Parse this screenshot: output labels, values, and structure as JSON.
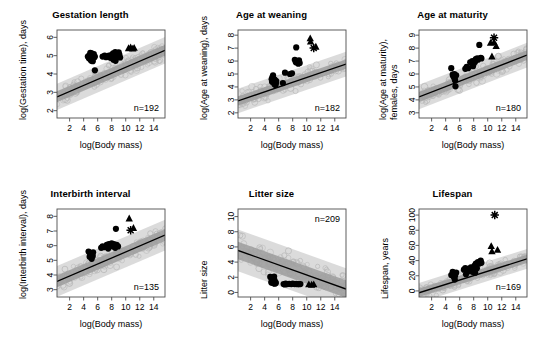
{
  "figure": {
    "layout": "2 rows x 3 columns",
    "shared_xlabel": "log(Body mass)",
    "x_ticks": [
      2,
      4,
      6,
      8,
      10,
      12,
      14
    ],
    "xlim": [
      0.2,
      15.6
    ],
    "colors": {
      "point_primate": "#000000",
      "point_other": "#b8b8b8",
      "band_outer": "#d9d9d9",
      "band_inner": "#9e9e9e",
      "regression_line": "#000000",
      "axis": "#4d4d4d",
      "background": "#ffffff"
    },
    "marker_legend": [
      {
        "symbol": "filled-circle",
        "name": "circle-marker"
      },
      {
        "symbol": "filled-triangle",
        "name": "triangle-marker"
      },
      {
        "symbol": "star",
        "name": "star-marker"
      },
      {
        "symbol": "open-circle",
        "name": "open-circle-marker"
      }
    ]
  },
  "chart_data": [
    {
      "id": "gestation-length",
      "type": "scatter",
      "title": "Gestation length",
      "xlabel": "log(Body mass)",
      "ylabel": "log(Gestation time), days",
      "ylabel_lines": [
        "log(Gestation time), days"
      ],
      "n_label": "n=192",
      "n": 192,
      "n_position": "bottom-right",
      "xlim": [
        0.2,
        15.6
      ],
      "ylim": [
        1.6,
        6.4
      ],
      "x_ticks": [
        2,
        4,
        6,
        8,
        10,
        12,
        14
      ],
      "y_ticks": [
        2,
        3,
        4,
        5,
        6
      ],
      "grid": false,
      "regression": {
        "intercept": 2.72,
        "slope": 0.165
      },
      "band_inner_halfwidth": 0.3,
      "band_outer_halfwidth": 0.72,
      "series": [
        {
          "name": "primates-circles",
          "marker": "filled-circle",
          "points": [
            [
              4.6,
              4.95
            ],
            [
              4.8,
              5.02
            ],
            [
              4.9,
              4.88
            ],
            [
              5.0,
              5.05
            ],
            [
              5.1,
              4.92
            ],
            [
              5.2,
              5.0
            ],
            [
              5.0,
              4.78
            ],
            [
              5.25,
              4.83
            ],
            [
              4.75,
              4.86
            ],
            [
              5.35,
              4.97
            ],
            [
              5.1,
              4.72
            ],
            [
              5.3,
              4.7
            ],
            [
              5.5,
              4.9
            ],
            [
              5.45,
              5.08
            ],
            [
              5.6,
              4.95
            ],
            [
              5.15,
              5.12
            ],
            [
              4.95,
              5.15
            ],
            [
              5.6,
              4.2
            ],
            [
              6.7,
              4.95
            ],
            [
              7.0,
              5.0
            ],
            [
              7.2,
              4.92
            ],
            [
              7.6,
              5.0
            ],
            [
              8.0,
              5.05
            ],
            [
              8.1,
              4.9
            ],
            [
              8.2,
              5.12
            ],
            [
              8.35,
              5.0
            ],
            [
              8.4,
              4.85
            ],
            [
              8.5,
              5.2
            ],
            [
              8.6,
              5.05
            ],
            [
              8.7,
              4.9
            ],
            [
              8.8,
              5.1
            ],
            [
              8.9,
              4.95
            ],
            [
              9.0,
              5.18
            ],
            [
              9.1,
              5.05
            ],
            [
              8.25,
              4.78
            ],
            [
              8.55,
              4.72
            ],
            [
              9.2,
              4.9
            ],
            [
              7.8,
              4.88
            ]
          ]
        },
        {
          "name": "great-apes-triangles",
          "marker": "filled-triangle",
          "points": [
            [
              10.4,
              5.4
            ],
            [
              10.7,
              5.45
            ],
            [
              11.0,
              5.38
            ],
            [
              11.2,
              5.42
            ]
          ]
        }
      ]
    },
    {
      "id": "age-at-weaning",
      "type": "scatter",
      "title": "Age at weaning",
      "xlabel": "log(Body mass)",
      "ylabel": "log(Age at weaning), days",
      "ylabel_lines": [
        "log(Age at weaning), days"
      ],
      "n_label": "n=182",
      "n": 182,
      "n_position": "bottom-right",
      "xlim": [
        0.2,
        15.6
      ],
      "ylim": [
        1.6,
        8.4
      ],
      "x_ticks": [
        2,
        4,
        6,
        8,
        10,
        12,
        14
      ],
      "y_ticks": [
        2,
        3,
        4,
        5,
        6,
        7,
        8
      ],
      "grid": false,
      "regression": {
        "intercept": 2.88,
        "slope": 0.185
      },
      "band_inner_halfwidth": 0.36,
      "band_outer_halfwidth": 0.95,
      "series": [
        {
          "name": "primates-circles",
          "marker": "filled-circle",
          "points": [
            [
              5.0,
              4.6
            ],
            [
              5.1,
              4.75
            ],
            [
              5.2,
              4.5
            ],
            [
              5.3,
              4.62
            ],
            [
              5.35,
              4.3
            ],
            [
              5.4,
              4.2
            ],
            [
              5.5,
              4.35
            ],
            [
              5.55,
              4.15
            ],
            [
              5.6,
              4.28
            ],
            [
              5.2,
              4.9
            ],
            [
              5.05,
              4.4
            ],
            [
              5.45,
              4.55
            ],
            [
              5.65,
              4.45
            ],
            [
              6.6,
              4.3
            ],
            [
              6.9,
              5.1
            ],
            [
              7.6,
              5.0
            ],
            [
              7.9,
              5.05
            ],
            [
              8.3,
              6.1
            ],
            [
              8.5,
              7.05
            ],
            [
              8.6,
              5.95
            ],
            [
              8.8,
              5.8
            ],
            [
              9.0,
              5.85
            ],
            [
              8.9,
              6.05
            ],
            [
              8.45,
              5.9
            ]
          ]
        },
        {
          "name": "great-apes-triangles",
          "marker": "filled-triangle",
          "points": [
            [
              10.5,
              7.75
            ],
            [
              10.55,
              7.5
            ],
            [
              11.3,
              7.1
            ]
          ]
        },
        {
          "name": "human-star",
          "marker": "star",
          "points": [
            [
              11.0,
              7.0
            ]
          ]
        }
      ]
    },
    {
      "id": "age-at-maturity",
      "type": "scatter",
      "title": "Age at maturity",
      "xlabel": "log(Body mass)",
      "ylabel": "log(Age at maturity), females, days",
      "ylabel_lines": [
        "log(Age at maturity),",
        "females, days"
      ],
      "n_label": "n=180",
      "n": 180,
      "n_position": "bottom-right",
      "xlim": [
        0.2,
        15.6
      ],
      "ylim": [
        2.6,
        9.4
      ],
      "x_ticks": [
        2,
        4,
        6,
        8,
        10,
        12,
        14
      ],
      "y_ticks": [
        3,
        4,
        5,
        6,
        7,
        8,
        9
      ],
      "grid": false,
      "regression": {
        "intercept": 4.18,
        "slope": 0.21
      },
      "band_inner_halfwidth": 0.38,
      "band_outer_halfwidth": 0.95,
      "series": [
        {
          "name": "primates-circles",
          "marker": "filled-circle",
          "points": [
            [
              4.8,
              6.45
            ],
            [
              5.0,
              5.95
            ],
            [
              5.1,
              5.8
            ],
            [
              5.2,
              5.85
            ],
            [
              5.25,
              6.0
            ],
            [
              5.3,
              5.6
            ],
            [
              5.35,
              5.5
            ],
            [
              5.4,
              5.05
            ],
            [
              5.5,
              5.9
            ],
            [
              6.8,
              6.4
            ],
            [
              7.0,
              6.55
            ],
            [
              7.2,
              6.45
            ],
            [
              7.5,
              6.9
            ],
            [
              7.8,
              7.0
            ],
            [
              8.0,
              6.8
            ],
            [
              8.3,
              7.15
            ],
            [
              8.5,
              7.2
            ],
            [
              8.6,
              7.1
            ],
            [
              8.8,
              8.25
            ],
            [
              9.0,
              7.25
            ],
            [
              9.1,
              7.2
            ],
            [
              8.2,
              6.95
            ],
            [
              7.9,
              6.6
            ]
          ]
        },
        {
          "name": "great-apes-triangles",
          "marker": "filled-triangle",
          "points": [
            [
              10.4,
              8.4
            ],
            [
              10.9,
              8.45
            ],
            [
              11.2,
              8.15
            ],
            [
              10.6,
              7.35
            ]
          ]
        },
        {
          "name": "human-star",
          "marker": "star",
          "points": [
            [
              10.9,
              8.8
            ]
          ]
        }
      ]
    },
    {
      "id": "interbirth-interval",
      "type": "scatter",
      "title": "Interbirth interval",
      "xlabel": "log(Body mass)",
      "ylabel": "log(Interbirth interval), days",
      "ylabel_lines": [
        "log(Interbirth interval), days"
      ],
      "n_label": "n=135",
      "n": 135,
      "n_position": "bottom-right",
      "xlim": [
        0.2,
        15.6
      ],
      "ylim": [
        2.5,
        8.5
      ],
      "x_ticks": [
        2,
        4,
        6,
        8,
        10,
        12,
        14
      ],
      "y_ticks": [
        3,
        4,
        5,
        6,
        7,
        8
      ],
      "grid": false,
      "regression": {
        "intercept": 3.52,
        "slope": 0.205
      },
      "band_inner_halfwidth": 0.4,
      "band_outer_halfwidth": 1.05,
      "series": [
        {
          "name": "primates-circles",
          "marker": "filled-circle",
          "points": [
            [
              4.7,
              5.6
            ],
            [
              4.9,
              5.5
            ],
            [
              5.0,
              5.35
            ],
            [
              5.1,
              5.2
            ],
            [
              5.2,
              5.45
            ],
            [
              5.3,
              5.3
            ],
            [
              5.15,
              5.1
            ],
            [
              5.35,
              5.55
            ],
            [
              4.85,
              5.25
            ],
            [
              6.5,
              5.85
            ],
            [
              6.7,
              5.95
            ],
            [
              6.9,
              5.9
            ],
            [
              7.3,
              6.05
            ],
            [
              7.6,
              6.1
            ],
            [
              7.8,
              6.0
            ],
            [
              8.0,
              6.15
            ],
            [
              8.2,
              5.95
            ],
            [
              8.3,
              6.1
            ],
            [
              8.5,
              5.85
            ],
            [
              8.7,
              6.05
            ],
            [
              8.9,
              5.95
            ],
            [
              8.6,
              7.15
            ],
            [
              7.5,
              5.8
            ],
            [
              8.1,
              6.0
            ]
          ]
        },
        {
          "name": "great-apes-triangles",
          "marker": "filled-triangle",
          "points": [
            [
              10.5,
              7.85
            ],
            [
              11.1,
              7.2
            ]
          ]
        },
        {
          "name": "human-star",
          "marker": "star",
          "points": [
            [
              10.7,
              7.05
            ]
          ]
        }
      ]
    },
    {
      "id": "litter-size",
      "type": "scatter",
      "title": "Litter size",
      "xlabel": "log(Body mass)",
      "ylabel": "Litter size",
      "ylabel_lines": [
        "Litter size"
      ],
      "n_label": "n=209",
      "n": 209,
      "n_position": "top-right",
      "xlim": [
        0.2,
        15.6
      ],
      "ylim": [
        -0.6,
        11.0
      ],
      "x_ticks": [
        2,
        4,
        6,
        8,
        10,
        12,
        14
      ],
      "y_ticks": [
        0,
        2,
        4,
        6,
        8,
        10
      ],
      "grid": false,
      "regression": {
        "intercept": 5.6,
        "slope": -0.33
      },
      "band_inner_halfwidth": 1.15,
      "band_outer_halfwidth": 2.75,
      "series": [
        {
          "name": "primates-circles",
          "marker": "filled-circle",
          "points": [
            [
              4.8,
              2.05
            ],
            [
              5.0,
              1.5
            ],
            [
              5.1,
              1.3
            ],
            [
              5.2,
              1.45
            ],
            [
              5.3,
              1.2
            ],
            [
              5.35,
              2.1
            ],
            [
              5.4,
              1.6
            ],
            [
              5.5,
              1.35
            ],
            [
              5.6,
              1.25
            ],
            [
              5.15,
              1.75
            ],
            [
              4.95,
              1.3
            ],
            [
              5.45,
              1.15
            ],
            [
              6.7,
              1.1
            ],
            [
              7.0,
              1.15
            ],
            [
              7.2,
              1.1
            ],
            [
              7.5,
              1.12
            ],
            [
              7.8,
              1.1
            ],
            [
              8.0,
              1.15
            ],
            [
              8.3,
              1.1
            ],
            [
              8.5,
              1.12
            ],
            [
              8.7,
              1.08
            ],
            [
              8.9,
              1.1
            ],
            [
              9.1,
              1.1
            ],
            [
              6.9,
              1.05
            ]
          ]
        },
        {
          "name": "great-apes-triangles",
          "marker": "filled-triangle",
          "points": [
            [
              10.3,
              1.05
            ],
            [
              10.7,
              1.0
            ],
            [
              11.0,
              1.05
            ]
          ]
        }
      ]
    },
    {
      "id": "lifespan",
      "type": "scatter",
      "title": "Lifespan",
      "xlabel": "log(Body mass)",
      "ylabel": "Lifespan, years",
      "ylabel_lines": [
        "Lifespan, years"
      ],
      "n_label": "n=169",
      "n": 169,
      "n_position": "bottom-right",
      "xlim": [
        0.2,
        15.6
      ],
      "ylim": [
        -8,
        108
      ],
      "x_ticks": [
        2,
        4,
        6,
        8,
        10,
        12,
        14
      ],
      "y_ticks": [
        0,
        20,
        40,
        60,
        80,
        100
      ],
      "grid": false,
      "regression": {
        "intercept": -3.0,
        "slope": 2.9
      },
      "band_inner_halfwidth": 5.5,
      "band_outer_halfwidth": 13.0,
      "series": [
        {
          "name": "primates-circles",
          "marker": "filled-circle",
          "points": [
            [
              4.8,
              21
            ],
            [
              5.0,
              25
            ],
            [
              5.1,
              19
            ],
            [
              5.2,
              23
            ],
            [
              5.3,
              15
            ],
            [
              5.35,
              20
            ],
            [
              5.5,
              24
            ],
            [
              6.6,
              28
            ],
            [
              6.8,
              30
            ],
            [
              7.0,
              27
            ],
            [
              7.2,
              29
            ],
            [
              7.4,
              26
            ],
            [
              7.6,
              31
            ],
            [
              7.9,
              25
            ],
            [
              8.1,
              33
            ],
            [
              8.3,
              36
            ],
            [
              8.45,
              30
            ],
            [
              8.6,
              38
            ],
            [
              8.8,
              36
            ],
            [
              9.0,
              40
            ],
            [
              9.1,
              37
            ],
            [
              8.2,
              24
            ],
            [
              6.9,
              22
            ]
          ]
        },
        {
          "name": "great-apes-triangles",
          "marker": "filled-triangle",
          "points": [
            [
              10.5,
              59
            ],
            [
              10.6,
              52
            ],
            [
              11.4,
              54
            ]
          ]
        },
        {
          "name": "human-star",
          "marker": "star",
          "points": [
            [
              11.0,
              100
            ]
          ]
        }
      ]
    }
  ]
}
